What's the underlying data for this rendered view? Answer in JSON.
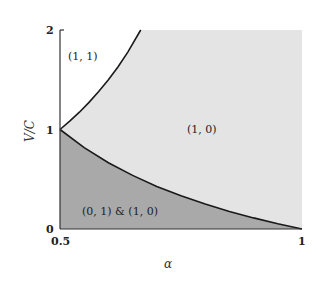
{
  "chart_data": {
    "type": "area",
    "title": "",
    "xlabel": "α",
    "ylabel": "V/C",
    "xlim": [
      0.5,
      1
    ],
    "ylim": [
      0,
      2
    ],
    "grid": false,
    "legend": null,
    "xticks": [
      {
        "value": 0.5,
        "label": "0.5"
      },
      {
        "value": 1,
        "label": "1"
      }
    ],
    "yticks": [
      {
        "value": 0,
        "label": "0"
      },
      {
        "value": 1,
        "label": "1"
      },
      {
        "value": 2,
        "label": "2"
      }
    ],
    "colors": {
      "background": "#ffffff",
      "light_region": "#e4e4e4",
      "dark_region": "#a9a9a9",
      "curve": "#1a1a1a",
      "axis": "#333333"
    },
    "series": [
      {
        "name": "upper boundary V/C = α/(1−α)",
        "x": [
          0.5,
          0.52,
          0.54,
          0.56,
          0.58,
          0.6,
          0.62,
          0.64,
          0.6667
        ],
        "y": [
          1.0,
          1.0833,
          1.1739,
          1.2727,
          1.381,
          1.5,
          1.6316,
          1.7778,
          2.0
        ]
      },
      {
        "name": "lower boundary V/C = (1−α)/α",
        "x": [
          0.5,
          0.55,
          0.6,
          0.65,
          0.7,
          0.75,
          0.8,
          0.85,
          0.9,
          0.95,
          1.0
        ],
        "y": [
          1.0,
          0.8182,
          0.6667,
          0.5385,
          0.4286,
          0.3333,
          0.25,
          0.1765,
          0.1111,
          0.0526,
          0.0
        ]
      }
    ],
    "regions": [
      {
        "label": "(1, 1)",
        "shade": "white",
        "description": "above upper boundary",
        "label_pos": [
          0.53,
          1.7
        ]
      },
      {
        "label": "(1, 0)",
        "shade": "light",
        "description": "between boundaries",
        "label_pos": [
          0.78,
          0.97
        ]
      },
      {
        "label": "(0, 1) & (1, 0)",
        "shade": "dark",
        "description": "below lower boundary",
        "label_pos": [
          0.64,
          0.14
        ]
      }
    ]
  }
}
